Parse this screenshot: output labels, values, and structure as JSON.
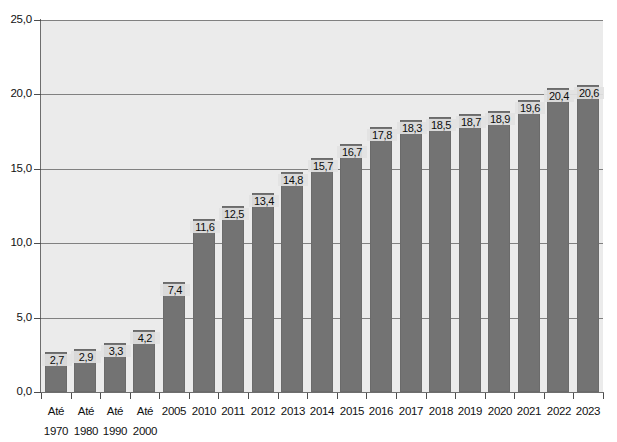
{
  "chart_data": {
    "type": "bar",
    "title": "",
    "subtitle": "",
    "xlabel": "",
    "ylabel": "",
    "ylim": [
      0,
      25
    ],
    "ytick_values": [
      0,
      5,
      10,
      15,
      20,
      25
    ],
    "ytick_labels": [
      "0,0",
      "5,0",
      "10,0",
      "15,0",
      "20,0",
      "25,0"
    ],
    "grid": true,
    "gridlines_at": [
      5,
      10,
      15,
      20,
      25
    ],
    "legend": null,
    "legend_position": "none",
    "decimal_separator": ",",
    "categories": [
      "Até 1970",
      "Até 1980",
      "Até 1990",
      "Até 2000",
      "2005",
      "2010",
      "2011",
      "2012",
      "2013",
      "2014",
      "2015",
      "2016",
      "2017",
      "2018",
      "2019",
      "2020",
      "2021",
      "2022",
      "2023"
    ],
    "category_lines": [
      [
        "Até",
        "1970"
      ],
      [
        "Até",
        "1980"
      ],
      [
        "Até",
        "1990"
      ],
      [
        "Até",
        "2000"
      ],
      [
        "2005",
        ""
      ],
      [
        "2010",
        ""
      ],
      [
        "2011",
        ""
      ],
      [
        "2012",
        ""
      ],
      [
        "2013",
        ""
      ],
      [
        "2014",
        ""
      ],
      [
        "2015",
        ""
      ],
      [
        "2016",
        ""
      ],
      [
        "2017",
        ""
      ],
      [
        "2018",
        ""
      ],
      [
        "2019",
        ""
      ],
      [
        "2020",
        ""
      ],
      [
        "2021",
        ""
      ],
      [
        "2022",
        ""
      ],
      [
        "2023",
        ""
      ]
    ],
    "values": [
      2.7,
      2.9,
      3.3,
      4.2,
      7.4,
      11.6,
      12.5,
      13.4,
      14.8,
      15.7,
      16.7,
      17.8,
      18.3,
      18.5,
      18.7,
      18.9,
      19.6,
      20.4,
      20.6
    ],
    "value_labels": [
      "2,7",
      "2,9",
      "3,3",
      "4,2",
      "7,4",
      "11,6",
      "12,5",
      "13,4",
      "14,8",
      "15,7",
      "16,7",
      "17,8",
      "18,3",
      "18,5",
      "18,7",
      "18,9",
      "19,6",
      "20,4",
      "20,6"
    ],
    "colors": {
      "bar": "#737373",
      "bar_border": "#6b6b6b",
      "plot_background": "#ebebeb",
      "page_background": "#ffffff",
      "gridline": "#808080",
      "axis": "#6e6e6e",
      "text": "#111111",
      "label_background": "#e2e2e2"
    }
  }
}
